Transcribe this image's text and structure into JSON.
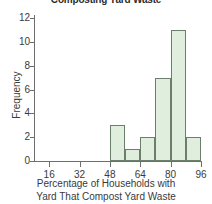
{
  "chart_data": {
    "type": "bar",
    "title": "Composting Yard Waste",
    "xlabel_line1": "Percentage of Households with",
    "xlabel_line2": "Yard That Compost Yard Waste",
    "ylabel": "Frequency",
    "categories": [
      "48-56",
      "56-64",
      "64-72",
      "72-80",
      "80-88",
      "88-96"
    ],
    "bin_edges": [
      48,
      56,
      64,
      72,
      80,
      88,
      96
    ],
    "bin_width": 8,
    "values": [
      3,
      1,
      2,
      7,
      11,
      2
    ],
    "xlim": [
      8,
      96
    ],
    "ylim": [
      0,
      12
    ],
    "xticks": [
      16,
      32,
      48,
      64,
      80,
      96
    ],
    "xtick_labels": [
      "16",
      "32",
      "48",
      "64",
      "80",
      "96"
    ],
    "yticks": [
      0,
      2,
      4,
      6,
      8,
      10,
      12
    ],
    "ytick_labels": [
      "0",
      "2",
      "4",
      "6",
      "8",
      "10",
      "12"
    ],
    "grid": false,
    "legend": false,
    "bar_fill_color": "#dfeedd",
    "bar_edge_color": "#6b7f6b",
    "axis_color": "#6e6e6e",
    "text_color": "#3a3a3a",
    "background_color": "#ffffff"
  }
}
